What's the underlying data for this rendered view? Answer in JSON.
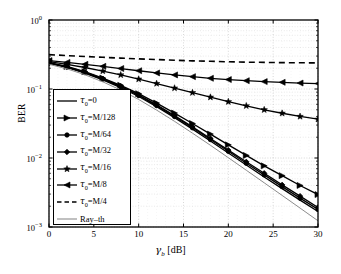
{
  "chart_data": {
    "type": "line",
    "title": "",
    "xlabel": "γ_b [dB]",
    "ylabel": "BER",
    "xlim": [
      0,
      30
    ],
    "ylim": [
      0.001,
      1
    ],
    "yscale": "log",
    "grid": true,
    "legend_position": "lower-left-inside",
    "xticklabels": [
      "0",
      "5",
      "10",
      "15",
      "20",
      "25",
      "30"
    ],
    "xticks": [
      0,
      5,
      10,
      15,
      20,
      25,
      30
    ],
    "yticklabels": [
      "10^0",
      "10^-1",
      "10^-2",
      "10^-3"
    ],
    "yticks": [
      1,
      0.1,
      0.01,
      0.001
    ],
    "x": [
      0,
      2,
      4,
      6,
      8,
      10,
      12,
      14,
      16,
      18,
      20,
      22,
      24,
      26,
      28,
      30
    ],
    "series": [
      {
        "name": "tau_0=0",
        "label": "τ₀=0",
        "marker": "none",
        "style": "solid",
        "color": "#000000",
        "values": [
          0.235,
          0.205,
          0.17,
          0.136,
          0.105,
          0.078,
          0.0555,
          0.0385,
          0.0262,
          0.0176,
          0.0118,
          0.0079,
          0.0053,
          0.0036,
          0.00245,
          0.00168
        ]
      },
      {
        "name": "tau_0=M/128",
        "label": "τ₀=M/128",
        "marker": "right-triangle",
        "style": "solid",
        "color": "#000000",
        "values": [
          0.242,
          0.212,
          0.178,
          0.144,
          0.113,
          0.0855,
          0.0625,
          0.0448,
          0.0316,
          0.0222,
          0.0155,
          0.0109,
          0.0077,
          0.00555,
          0.004,
          0.00295
        ]
      },
      {
        "name": "tau_0=M/64",
        "label": "τ₀=M/64",
        "marker": "circle",
        "style": "solid",
        "color": "#000000",
        "values": [
          0.238,
          0.208,
          0.173,
          0.139,
          0.108,
          0.0805,
          0.0575,
          0.04,
          0.0274,
          0.0185,
          0.0125,
          0.0084,
          0.0057,
          0.00385,
          0.00262,
          0.0018
        ]
      },
      {
        "name": "tau_0=M/32",
        "label": "τ₀=M/32",
        "marker": "diamond",
        "style": "solid",
        "color": "#000000",
        "values": [
          0.24,
          0.21,
          0.175,
          0.141,
          0.11,
          0.0822,
          0.059,
          0.0412,
          0.0283,
          0.0192,
          0.013,
          0.0088,
          0.006,
          0.00408,
          0.0028,
          0.00192
        ]
      },
      {
        "name": "tau_0=M/16",
        "label": "τ₀=M/16",
        "marker": "star",
        "style": "solid",
        "color": "#000000",
        "values": [
          0.25,
          0.228,
          0.205,
          0.182,
          0.16,
          0.139,
          0.12,
          0.103,
          0.0885,
          0.076,
          0.0655,
          0.057,
          0.05,
          0.0445,
          0.04,
          0.0365
        ]
      },
      {
        "name": "tau_0=M/8",
        "label": "τ₀=M/8",
        "marker": "left-triangle",
        "style": "solid",
        "color": "#000000",
        "values": [
          0.258,
          0.243,
          0.228,
          0.213,
          0.198,
          0.184,
          0.171,
          0.16,
          0.151,
          0.143,
          0.137,
          0.132,
          0.128,
          0.125,
          0.122,
          0.12
        ]
      },
      {
        "name": "tau_0=M/4",
        "label": "τ₀=M/4",
        "marker": "none",
        "style": "dashed",
        "color": "#000000",
        "values": [
          0.315,
          0.305,
          0.296,
          0.288,
          0.28,
          0.273,
          0.267,
          0.261,
          0.256,
          0.252,
          0.248,
          0.245,
          0.243,
          0.241,
          0.24,
          0.239
        ]
      },
      {
        "name": "Ray-th",
        "label": "Ray–th",
        "marker": "none",
        "style": "solid-thin",
        "color": "#8c8c8c",
        "values": [
          0.228,
          0.196,
          0.161,
          0.127,
          0.0965,
          0.0705,
          0.0495,
          0.034,
          0.0229,
          0.0153,
          0.0101,
          0.00665,
          0.00437,
          0.00287,
          0.00188,
          0.00123
        ]
      }
    ]
  },
  "axes": {
    "ylabel": "BER",
    "xlabel_prefix": "γ",
    "xlabel_sub": "b",
    "xlabel_suffix": "[dB]"
  }
}
